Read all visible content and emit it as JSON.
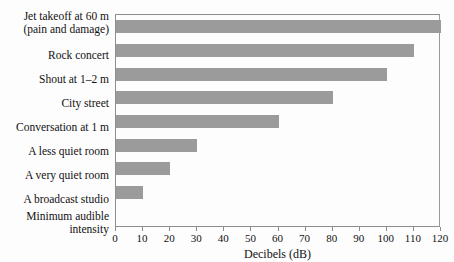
{
  "chart_data": {
    "type": "bar",
    "orientation": "horizontal",
    "title": "",
    "xlabel": "Decibels (dB)",
    "ylabel": "",
    "xlim": [
      0,
      120
    ],
    "xticks": [
      0,
      10,
      20,
      30,
      40,
      50,
      60,
      70,
      80,
      90,
      100,
      110,
      120
    ],
    "grid": false,
    "legend": false,
    "bar_color": "#9b9b9b",
    "frame_color": "#8d8d8d",
    "background": "#fdfdfd",
    "categories": [
      "Jet takeoff at 60 m (pain and damage)",
      "Rock concert",
      "Shout at 1–2 m",
      "City street",
      "Conversation at 1 m",
      "A less quiet room",
      "A very quiet room",
      "A broadcast studio",
      "Minimum audible intensity"
    ],
    "values": [
      120,
      110,
      100,
      80,
      60,
      30,
      20,
      10,
      0
    ]
  },
  "labels": {
    "l0_line1": "Jet takeoff at 60 m",
    "l0_line2": "(pain and damage)",
    "l1": "Rock concert",
    "l2": "Shout at 1–2 m",
    "l3": "City street",
    "l4": "Conversation at 1 m",
    "l5": "A less quiet room",
    "l6": "A very quiet room",
    "l7": "A broadcast studio",
    "l8_line1": "Minimum audible",
    "l8_line2": "intensity"
  },
  "axis": {
    "title": "Decibels (dB)",
    "tick_labels": [
      "0",
      "10",
      "20",
      "30",
      "40",
      "50",
      "60",
      "70",
      "80",
      "90",
      "100",
      "110",
      "120"
    ]
  }
}
